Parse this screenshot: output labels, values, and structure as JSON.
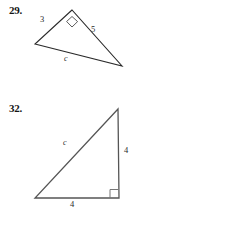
{
  "page": {
    "background_color": "#ffffff",
    "ink_color": "#2a2a2a",
    "width": 231,
    "height": 232
  },
  "problems": [
    {
      "number_label": "29.",
      "figure_type": "triangle",
      "right_angle_vertex": "apex",
      "right_angle_marker": "diamond",
      "vertices": {
        "apex": [
          72,
          10
        ],
        "left": [
          35,
          44
        ],
        "right": [
          122,
          66
        ]
      },
      "labels": {
        "left_leg": "3",
        "right_leg": "5",
        "hypotenuse": "c"
      }
    },
    {
      "number_label": "32.",
      "figure_type": "right-triangle",
      "right_angle_vertex": "bottom-right",
      "right_angle_marker": "square",
      "vertices": {
        "top": [
          118,
          14
        ],
        "bottom_left": [
          35,
          103
        ],
        "bottom_right": [
          119,
          103
        ]
      },
      "labels": {
        "hypotenuse": "c",
        "vertical_leg": "4",
        "horizontal_leg": "4"
      }
    }
  ]
}
